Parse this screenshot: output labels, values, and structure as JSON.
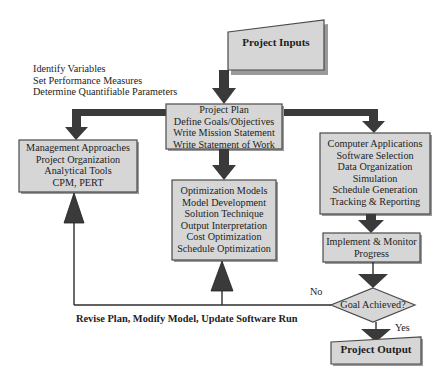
{
  "diagram": {
    "input": {
      "label": "Project Inputs"
    },
    "annotation_top": {
      "lines": [
        "Identify Variables",
        "Set Performance Measures",
        "Determine Quantifiable Parameters"
      ]
    },
    "project_plan": {
      "lines": [
        "Project Plan",
        "Define Goals/Objectives",
        "Write Mission Statement",
        "Write Statement of Work"
      ]
    },
    "management": {
      "lines": [
        "Management Approaches",
        "Project Organization",
        "Analytical Tools",
        "CPM, PERT"
      ]
    },
    "optimization": {
      "lines": [
        "Optimization Models",
        "Model Development",
        "Solution Technique",
        "Output Interpretation",
        "Cost Optimization",
        "Schedule Optimization"
      ]
    },
    "computer": {
      "lines": [
        "Computer Applications",
        "Software Selection",
        "Data Organization",
        "Simulation",
        "Schedule Generation",
        "Tracking & Reporting"
      ]
    },
    "implement": {
      "lines": [
        "Implement & Monitor",
        "Progress"
      ]
    },
    "decision": {
      "label": "Goal Achieved?",
      "no_label": "No",
      "yes_label": "Yes"
    },
    "feedback": {
      "label": "Revise Plan, Modify Model, Update Software Run"
    },
    "output": {
      "label": "Project Output"
    },
    "colors": {
      "box_fill": "#d6d6d6",
      "arrow": "#3a3a3a",
      "border": "#4a4a4a"
    }
  }
}
